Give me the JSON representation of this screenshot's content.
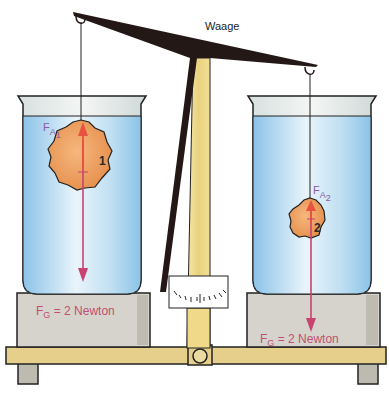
{
  "diagram": {
    "title": "Waage",
    "left": {
      "body_number": "1",
      "buoyancy_label": "F",
      "buoyancy_sub_a": "A",
      "buoyancy_sub_n": "1",
      "weight_label": "F",
      "weight_sub": "G",
      "weight_value": "= 2 Newton"
    },
    "right": {
      "body_number": "2",
      "buoyancy_label": "F",
      "buoyancy_sub_a": "A",
      "buoyancy_sub_n": "2",
      "weight_label": "F",
      "weight_sub": "G",
      "weight_value": "= 2 Newton"
    },
    "colors": {
      "beam": "#231815",
      "stand": "#f1dc8c",
      "base": "#e8d28e",
      "water": "#a9d3ee",
      "platform": "#d7d5cf",
      "body": "#ee9f5c",
      "force_arrow": "#c8436f",
      "buoyancy_arrow": "#e8533f"
    }
  }
}
